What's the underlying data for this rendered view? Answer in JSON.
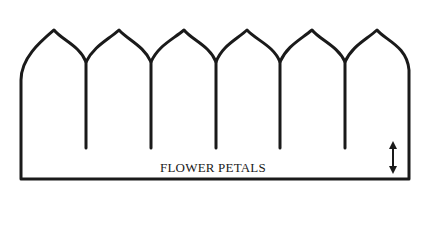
{
  "diagram": {
    "label": "FLOWER PETALS",
    "stroke_color": "#1a1a1a",
    "petal_count": 6,
    "indicator": "double-headed-vertical-arrow"
  }
}
